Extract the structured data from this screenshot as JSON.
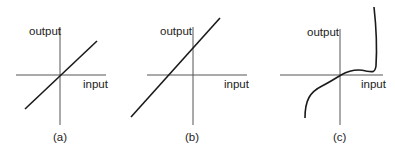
{
  "figure": {
    "panels": [
      {
        "id": "a",
        "caption": "(a)",
        "y_axis_label": "output",
        "x_axis_label": "input",
        "curve": "linear through origin, slope ~1"
      },
      {
        "id": "b",
        "caption": "(b)",
        "y_axis_label": "output",
        "x_axis_label": "input",
        "curve": "linear with positive offset, slope ~1.1"
      },
      {
        "id": "c",
        "caption": "(c)",
        "y_axis_label": "output",
        "x_axis_label": "input",
        "curve": "nonlinear: curves up from bottom-left, passes through origin, flattens, then rises steeply at right"
      }
    ],
    "colors": {
      "line": "#1a1a1a",
      "axis": "#555555",
      "text": "#222222"
    }
  }
}
